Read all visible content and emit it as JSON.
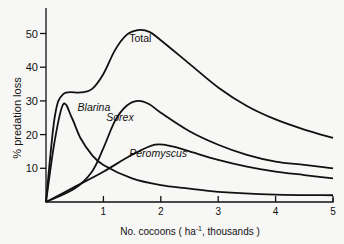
{
  "chart_data": {
    "type": "line",
    "title": "",
    "xlabel": "No. cocoons ( ha^-1, thousands )",
    "xlabel_parts": {
      "pre": "No. cocoons ( ha",
      "sup": "-1",
      "post": ", thousands )"
    },
    "ylabel": "% predation loss",
    "xlim": [
      0,
      5
    ],
    "ylim": [
      0,
      55
    ],
    "x_ticks": [
      1,
      2,
      3,
      4,
      5
    ],
    "y_ticks": [
      10,
      20,
      30,
      40,
      50
    ],
    "grid": false,
    "legend": "inline labels",
    "series": [
      {
        "name": "Total",
        "x": [
          0,
          0.15,
          0.3,
          0.6,
          0.8,
          1.0,
          1.2,
          1.4,
          1.6,
          1.8,
          2.0,
          2.5,
          3.0,
          3.5,
          4.0,
          4.5,
          5.0
        ],
        "values": [
          0,
          25,
          32,
          32.5,
          33.5,
          38,
          45,
          49.5,
          51,
          50.5,
          48,
          41,
          34,
          28.5,
          24.5,
          21.5,
          19
        ]
      },
      {
        "name": "Blarina",
        "x": [
          0,
          0.15,
          0.3,
          0.45,
          0.6,
          0.8,
          1.0,
          1.5,
          2.0,
          2.5,
          3.0,
          4.0,
          5.0
        ],
        "values": [
          0,
          18,
          29,
          25,
          19,
          14,
          11,
          7,
          5,
          4,
          3,
          2.2,
          2
        ]
      },
      {
        "name": "Sorex",
        "x": [
          0,
          0.5,
          0.8,
          1.0,
          1.2,
          1.4,
          1.6,
          1.8,
          2.0,
          2.5,
          3.0,
          3.5,
          4.0,
          4.5,
          5.0
        ],
        "values": [
          0,
          4,
          9,
          16,
          24,
          28.5,
          30,
          29,
          26.5,
          21,
          17,
          14,
          12,
          11,
          10
        ]
      },
      {
        "name": "Peromyscus",
        "x": [
          0,
          0.5,
          1.0,
          1.5,
          1.9,
          2.2,
          2.5,
          3.0,
          3.5,
          4.0,
          4.5,
          5.0
        ],
        "values": [
          0,
          4.5,
          9,
          14,
          17,
          16.5,
          15,
          12.5,
          10.5,
          9,
          8,
          7
        ]
      }
    ],
    "annotations": [
      {
        "text": "Total",
        "x": 1.45,
        "y": 47.5
      },
      {
        "text": "Blarina",
        "x": 0.55,
        "y": 27
      },
      {
        "text": "Sorex",
        "x": 1.05,
        "y": 24
      },
      {
        "text": "Peromyscus",
        "x": 1.45,
        "y": 13.5
      }
    ]
  }
}
